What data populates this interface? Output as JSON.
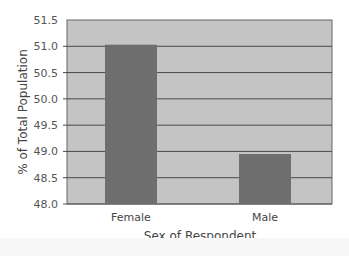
{
  "chart_data": {
    "type": "bar",
    "title": "",
    "xlabel": "Sex of Respondent",
    "ylabel": "% of Total Population",
    "categories": [
      "Female",
      "Male"
    ],
    "values": [
      51.03,
      48.95
    ],
    "ylim": [
      48.0,
      51.5
    ],
    "yticks": [
      "48.0",
      "48.5",
      "49.0",
      "49.5",
      "50.0",
      "50.5",
      "51.0",
      "51.5"
    ],
    "grid": true,
    "legend": null,
    "colors": {
      "plot_background": "#c4c4c4",
      "bar": "#6e6e6e",
      "gridline": "#4a4a4a",
      "text": "#444444"
    }
  }
}
